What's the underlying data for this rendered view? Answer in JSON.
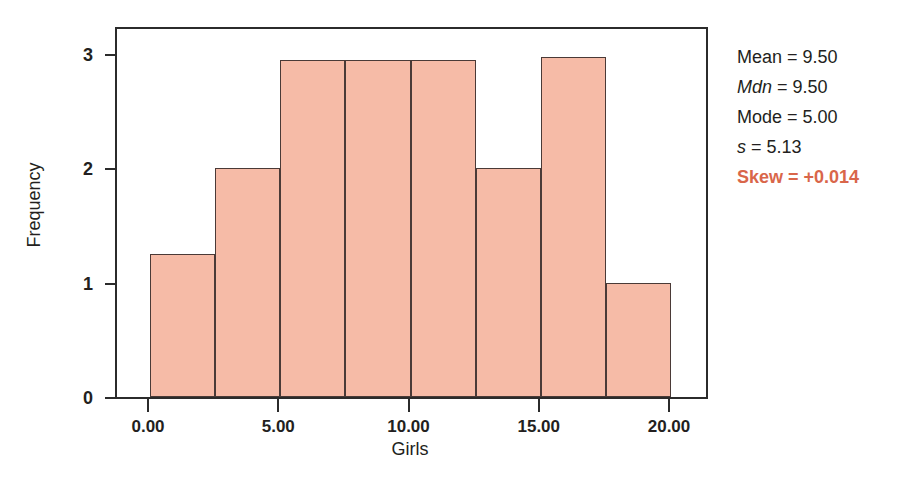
{
  "chart_data": {
    "type": "bar",
    "title": "",
    "xlabel": "Girls",
    "ylabel": "Frequency",
    "xlim": [
      0,
      20
    ],
    "ylim": [
      0,
      3
    ],
    "grid": false,
    "legend": "none",
    "bin_width": 2.5,
    "x_tick_labels": [
      "0.00",
      "5.00",
      "10.00",
      "15.00",
      "20.00"
    ],
    "x_tick_values": [
      0,
      5,
      10,
      15,
      20
    ],
    "y_tick_labels": [
      "0",
      "1",
      "2",
      "3"
    ],
    "y_tick_values": [
      0,
      1,
      2,
      3
    ],
    "categories": [
      "0.0-2.5",
      "2.5-5.0",
      "5.0-7.5",
      "7.5-10.0",
      "10.0-12.5",
      "12.5-15.0",
      "15.0-17.5",
      "17.5-20.0"
    ],
    "bin_starts": [
      0,
      2.5,
      5,
      7.5,
      10,
      12.5,
      15,
      17.5
    ],
    "values": [
      1.25,
      2,
      2.95,
      2.95,
      2.95,
      2,
      2.97,
      1
    ],
    "bar_fill_color": "#f6bba7",
    "bar_edge_color": "#4a3a37"
  },
  "stats": {
    "accent_color": "#d9664a",
    "items": [
      {
        "key": "Mean",
        "italic_key": false,
        "eq": "=",
        "value": "9.50",
        "highlight": false
      },
      {
        "key": "Mdn",
        "italic_key": true,
        "eq": "=",
        "value": "9.50",
        "highlight": false
      },
      {
        "key": "Mode",
        "italic_key": false,
        "eq": "=",
        "value": "5.00",
        "highlight": false
      },
      {
        "key": "s",
        "italic_key": true,
        "eq": "=",
        "value": "5.13",
        "highlight": false
      },
      {
        "key": "Skew",
        "italic_key": false,
        "eq": "=",
        "value": "+0.014",
        "highlight": true
      }
    ],
    "lines": [
      "Mean = 9.50",
      "Mdn = 9.50",
      "Mode = 5.00",
      "s = 5.13",
      "Skew = +0.014"
    ]
  }
}
